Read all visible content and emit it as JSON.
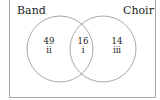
{
  "diagram": {
    "type": "venn",
    "sets": [
      {
        "name": "Band"
      },
      {
        "name": "Choir"
      }
    ],
    "regions": [
      {
        "id": "band-only",
        "count": "49",
        "roman": "ii"
      },
      {
        "id": "both",
        "count": "16",
        "roman": "i"
      },
      {
        "id": "choir-only",
        "count": "14",
        "roman": "iii"
      }
    ],
    "colors": {
      "circle_stroke": "#a8a8a8",
      "frame_stroke": "#a8a8a8",
      "text": "#222222"
    }
  }
}
